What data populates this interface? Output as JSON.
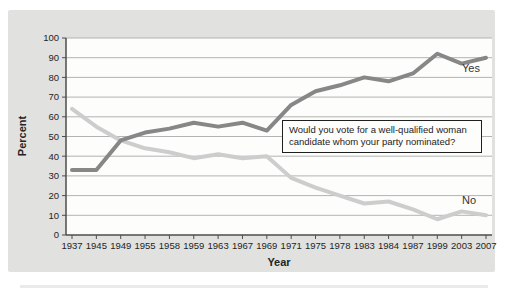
{
  "chart_data": {
    "type": "line",
    "title": "",
    "xlabel": "Year",
    "ylabel": "Percent",
    "ylim": [
      0,
      100
    ],
    "ytick_step": 10,
    "grid": true,
    "legend": "inline-labels-at-line-ends",
    "annotation": "Would you vote for a well-qualified woman candidate whom your party nominated?",
    "categories": [
      "1937",
      "1945",
      "1949",
      "1955",
      "1958",
      "1959",
      "1963",
      "1967",
      "1969",
      "1971",
      "1975",
      "1978",
      "1983",
      "1984",
      "1987",
      "1999",
      "2003",
      "2007"
    ],
    "series": [
      {
        "name": "Yes",
        "color": "#878787",
        "values": [
          33,
          33,
          48,
          52,
          54,
          57,
          55,
          57,
          53,
          66,
          73,
          76,
          80,
          78,
          82,
          92,
          87,
          90
        ]
      },
      {
        "name": "No",
        "color": "#cdcdcd",
        "values": [
          64,
          55,
          48,
          44,
          42,
          39,
          41,
          39,
          40,
          29,
          24,
          20,
          16,
          17,
          13,
          8,
          12,
          10
        ]
      }
    ],
    "colors": {
      "panel_bg": "#e1e1df",
      "plot_bg": "#fdfdfc",
      "gridline": "#b3b3b3",
      "axis": "#4d4d4d",
      "text": "#242424"
    }
  }
}
